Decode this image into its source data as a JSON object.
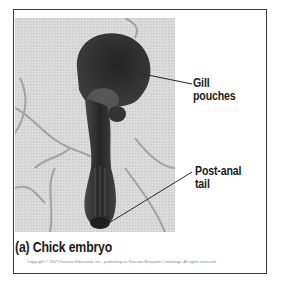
{
  "figure": {
    "panel_caption": "(a) Chick embryo",
    "copyright": "Copyright © 2007 Pearson Education, Inc., publishing as Pearson Benjamin Cummings. All rights reserved.",
    "image_subject": "chick-embryo-photo",
    "labels": [
      {
        "line1": "Gill",
        "line2": "pouches"
      },
      {
        "line1": "Post-anal",
        "line2": "tail"
      }
    ],
    "colors": {
      "frame": "#3a3a3a",
      "photo_background": "#d6d6d6",
      "embryo": "#2e2e2e",
      "text": "#1c1c1c"
    }
  }
}
